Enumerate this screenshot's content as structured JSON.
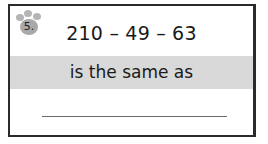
{
  "problem": {
    "number": "5.",
    "expression": "210 – 49 – 63",
    "prompt": "is the same as",
    "answer": ""
  },
  "colors": {
    "border": "#2b2b2b",
    "band": "#d9d9d9",
    "paw": "#b5b5b5",
    "text": "#1a1a1a"
  }
}
